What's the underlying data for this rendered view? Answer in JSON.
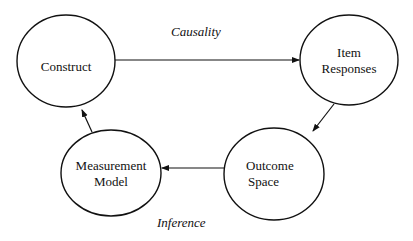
{
  "nodes": {
    "construct": {
      "line1": "Construct"
    },
    "item_responses": {
      "line1": "Item",
      "line2": "Responses"
    },
    "outcome_space": {
      "line1": "Outcome",
      "line2": "Space"
    },
    "measurement_model": {
      "line1": "Measurement",
      "line2": "Model"
    }
  },
  "edges": {
    "causality": "Causality",
    "inference": "Inference"
  },
  "colors": {
    "stroke": "#111111",
    "background": "#ffffff"
  }
}
